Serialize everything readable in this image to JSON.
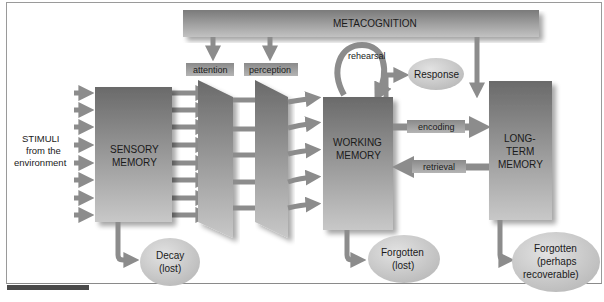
{
  "figure": {
    "colors": {
      "box_dark": "#6e6e6e",
      "box_light": "#c4c4c4",
      "arrow": "#8c8c8c",
      "ellipse": "#c8c8c8",
      "label_box": "#9a9a9a",
      "frame_border": "#9a9a9a",
      "tab_bar": "#4a4a4a",
      "background": "#ffffff"
    }
  },
  "stimuli": {
    "line1": "STIMULI",
    "line2": "from the",
    "line3": "environment"
  },
  "metacognition": {
    "label": "METACOGNITION"
  },
  "filters": {
    "attention": "attention",
    "perception": "perception"
  },
  "sensory_memory": {
    "line1": "SENSORY",
    "line2": "MEMORY"
  },
  "working_memory": {
    "line1": "WORKING",
    "line2": "MEMORY"
  },
  "long_term_memory": {
    "line1": "LONG-",
    "line2": "TERM",
    "line3": "MEMORY"
  },
  "processes": {
    "rehearsal": "rehearsal",
    "encoding": "encoding",
    "retrieval": "retrieval"
  },
  "outcomes": {
    "response": "Response",
    "decay": {
      "line1": "Decay",
      "line2": "(lost)"
    },
    "forgotten_wm": {
      "line1": "Forgotten",
      "line2": "(lost)"
    },
    "forgotten_ltm": {
      "line1": "Forgotten",
      "line2": "(perhaps",
      "line3": "recoverable)"
    }
  }
}
